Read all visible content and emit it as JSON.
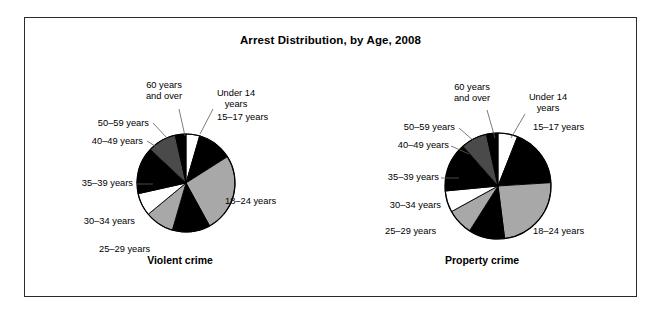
{
  "page": {
    "title": "Arrest Distribution, by Age, 2008",
    "background_color": "#ffffff",
    "frame_color": "#2b2b2b"
  },
  "palette": {
    "white": "#ffffff",
    "black": "#000000",
    "light_gray": "#a8a8a8",
    "dark_gray": "#4a4a4a",
    "outline": "#000000"
  },
  "charts": {
    "left": {
      "caption": "Violent crime",
      "labels": {
        "under14": "Under 14\nyears",
        "a15_17": "15–17 years",
        "a18_24": "18–24 years",
        "a25_29": "25–29 years",
        "a30_34": "30–34 years",
        "a35_39": "35–39 years",
        "a40_49": "40–49 years",
        "a50_59": "50–59 years",
        "a60plus": "60 years\nand over"
      }
    },
    "right": {
      "caption": "Property crime",
      "labels": {
        "under14": "Under 14\nyears",
        "a15_17": "15–17 years",
        "a18_24": "18–24 years",
        "a25_29": "25–29 years",
        "a30_34": "30–34 years",
        "a35_39": "35–39 years",
        "a40_49": "40–49 years",
        "a50_59": "50–59 years",
        "a60plus": "60 years\nand over"
      }
    }
  },
  "chart_data": [
    {
      "type": "pie",
      "title": "Violent crime",
      "subtitle": "Arrest Distribution, by Age, 2008",
      "categories": [
        "Under 14 years",
        "15–17 years",
        "18–24 years",
        "25–29 years",
        "30–34 years",
        "35–39 years",
        "40–49 years",
        "50–59 years",
        "60 years and over"
      ],
      "values": [
        4.5,
        11.5,
        26.0,
        12.5,
        9.5,
        7.5,
        15.5,
        9.5,
        3.5
      ],
      "units": "percent of arrests",
      "colors": [
        "#ffffff",
        "#000000",
        "#a8a8a8",
        "#000000",
        "#a8a8a8",
        "#ffffff",
        "#000000",
        "#4a4a4a",
        "#000000"
      ],
      "start_angle_deg": 0,
      "direction": "clockwise",
      "legend": "labels with leader lines around pie",
      "grid": false
    },
    {
      "type": "pie",
      "title": "Property crime",
      "subtitle": "Arrest Distribution, by Age, 2008",
      "categories": [
        "Under 14 years",
        "15–17 years",
        "18–24 years",
        "25–29 years",
        "30–34 years",
        "35–39 years",
        "40–49 years",
        "50–59 years",
        "60 years and over"
      ],
      "values": [
        6.0,
        18.0,
        24.0,
        11.0,
        8.0,
        6.5,
        15.0,
        8.0,
        3.5
      ],
      "units": "percent of arrests",
      "colors": [
        "#ffffff",
        "#000000",
        "#a8a8a8",
        "#000000",
        "#a8a8a8",
        "#ffffff",
        "#000000",
        "#4a4a4a",
        "#000000"
      ],
      "start_angle_deg": 0,
      "direction": "clockwise",
      "legend": "labels with leader lines around pie",
      "grid": false
    }
  ]
}
